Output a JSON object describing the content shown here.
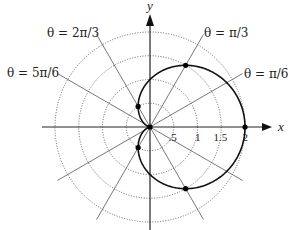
{
  "diagram": {
    "type": "polar-plot",
    "curve": "r = 1 + cos(theta)",
    "center": [
      150,
      127
    ],
    "scale_px_per_unit": 47.5,
    "grid_circles": [
      0.5,
      1,
      1.5,
      2
    ],
    "ray_angles_deg": [
      0,
      30,
      60,
      90,
      120,
      150,
      180,
      210,
      240,
      270,
      300,
      330
    ],
    "ray_length_units": 2.25,
    "axis_labels": {
      "x": "x",
      "y": "y"
    },
    "x_ticks": [
      {
        "value": 0.5,
        "label": ".5"
      },
      {
        "value": 1,
        "label": "1"
      },
      {
        "value": 1.5,
        "label": "1.5"
      },
      {
        "value": 2,
        "label": "2"
      }
    ],
    "angle_labels": [
      {
        "label": "θ = π/3",
        "x": 204,
        "y": 37
      },
      {
        "label": "θ = π/6",
        "x": 244,
        "y": 78
      },
      {
        "label": "θ = 2π/3",
        "x": 47,
        "y": 37
      },
      {
        "label": "θ = 5π/6",
        "x": 7,
        "y": 77
      }
    ],
    "marked_points": [
      {
        "theta": "0",
        "r": 2
      },
      {
        "theta": "π/3",
        "r": 1.5
      },
      {
        "theta": "2π/3",
        "r": 0.5
      },
      {
        "theta": "π",
        "r": 0
      },
      {
        "theta": "4π/3",
        "r": 0.5
      },
      {
        "theta": "5π/3",
        "r": 1.5
      }
    ],
    "colors": {
      "grid": "#555555",
      "curve": "#111111",
      "axis": "#222222"
    }
  }
}
